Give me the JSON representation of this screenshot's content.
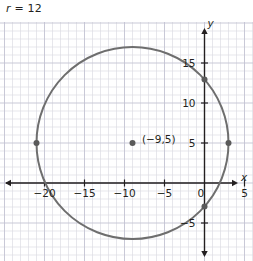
{
  "title": {
    "variable": "r",
    "equals": " = ",
    "value": "12",
    "full": "r = 12"
  },
  "colors": {
    "curve": "#6e6e6e",
    "axis": "#231f20",
    "grid_minor": "#dcdce4",
    "grid_major": "#c3c3d2",
    "text": "#231f20",
    "point": "#5a5a5a",
    "background": "#ffffff"
  },
  "chart_data": {
    "type": "scatter",
    "title": "r = 12",
    "xlabel": "x",
    "ylabel": "y",
    "grid": true,
    "legend": "none",
    "xlim": [
      -24,
      6
    ],
    "ylim": [
      -9,
      20
    ],
    "x_ticks": [
      -20,
      -15,
      -10,
      -5,
      0,
      5
    ],
    "x_tick_labels": [
      "−20",
      "−15",
      "−10",
      "−5",
      "0",
      "5"
    ],
    "y_ticks": [
      -5,
      5,
      10,
      15
    ],
    "y_tick_labels": [
      "−5",
      "5",
      "10",
      "15"
    ],
    "minor_grid_step": 1,
    "major_grid_step": 5,
    "shapes": [
      {
        "kind": "circle",
        "center": [
          -9,
          5
        ],
        "radius": 12,
        "stroke": "#6e6e6e",
        "fill": "none"
      }
    ],
    "points": [
      {
        "x": -9,
        "y": 5,
        "label": "(−9,5)",
        "role": "center"
      },
      {
        "x": -21,
        "y": 5,
        "label": "",
        "role": "left-endpoint"
      },
      {
        "x": 3,
        "y": 5,
        "label": "",
        "role": "right-endpoint"
      },
      {
        "x": 0,
        "y": 12.94,
        "label": "",
        "role": "y-intercept-upper"
      },
      {
        "x": 0,
        "y": -2.94,
        "label": "",
        "role": "y-intercept-lower"
      }
    ],
    "annotations": [
      {
        "text": "(−9,5)",
        "x": -8.2,
        "y": 5.4
      }
    ],
    "axis_labels": {
      "x": "x",
      "y": "y"
    }
  }
}
